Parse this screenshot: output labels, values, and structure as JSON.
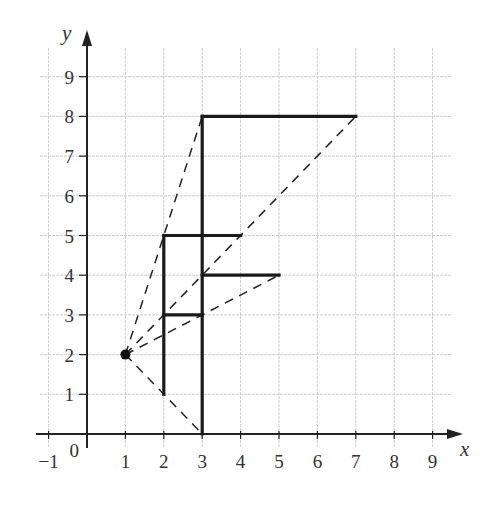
{
  "chart_data": {
    "type": "diagram",
    "xlabel": "x",
    "ylabel": "y",
    "xlim": [
      -1,
      9
    ],
    "ylim": [
      0,
      9
    ],
    "grid": true,
    "x_ticks": [
      "-1",
      "1",
      "2",
      "3",
      "4",
      "5",
      "6",
      "7",
      "8",
      "9"
    ],
    "x_tick_values": [
      -1,
      1,
      2,
      3,
      4,
      5,
      6,
      7,
      8,
      9
    ],
    "y_ticks": [
      "1",
      "2",
      "3",
      "4",
      "5",
      "6",
      "7",
      "8",
      "9"
    ],
    "y_tick_values": [
      1,
      2,
      3,
      4,
      5,
      6,
      7,
      8,
      9
    ],
    "origin_label": "0",
    "centre_of_enlargement": [
      1,
      2
    ],
    "shapes": [
      {
        "name": "object-F",
        "segments": [
          [
            [
              2,
              1
            ],
            [
              2,
              5
            ]
          ],
          [
            [
              2,
              5
            ],
            [
              4,
              5
            ]
          ],
          [
            [
              2,
              3
            ],
            [
              3,
              3
            ]
          ]
        ]
      },
      {
        "name": "image-F",
        "segments": [
          [
            [
              3,
              0
            ],
            [
              3,
              8
            ]
          ],
          [
            [
              3,
              8
            ],
            [
              7,
              8
            ]
          ],
          [
            [
              3,
              4
            ],
            [
              5,
              4
            ]
          ]
        ]
      }
    ],
    "ray_lines": [
      [
        [
          1,
          2
        ],
        [
          3,
          8
        ]
      ],
      [
        [
          1,
          2
        ],
        [
          7,
          8
        ]
      ],
      [
        [
          1,
          2
        ],
        [
          5,
          4
        ]
      ],
      [
        [
          1,
          2
        ],
        [
          3,
          0
        ]
      ]
    ],
    "colors": {
      "grid": "#cccccc",
      "axis": "#222222",
      "shape": "#1a1a1a",
      "ray": "#222222"
    }
  }
}
